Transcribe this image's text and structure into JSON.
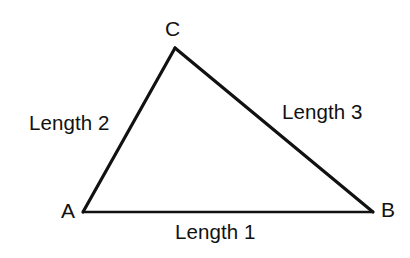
{
  "diagram": {
    "type": "triangle-geometry-diagram",
    "background_color": "#ffffff",
    "stroke_color": "#111111",
    "vertices": [
      {
        "id": "C",
        "label": "C",
        "x": 175,
        "y": 48
      },
      {
        "id": "A",
        "label": "A",
        "x": 83,
        "y": 212
      },
      {
        "id": "B",
        "label": "B",
        "x": 373,
        "y": 212
      }
    ],
    "edges": [
      {
        "id": "AB",
        "label": "Length 1",
        "from": "A",
        "to": "B",
        "stroke_width": 2.4
      },
      {
        "id": "AC",
        "label": "Length 2",
        "from": "A",
        "to": "C",
        "stroke_width": 3.2
      },
      {
        "id": "CB",
        "label": "Length 3",
        "from": "C",
        "to": "B",
        "stroke_width": 3.2
      }
    ],
    "vertex_labels": {
      "c": "C",
      "a": "A",
      "b": "B"
    },
    "edge_labels": {
      "length_1": "Length 1",
      "length_2": "Length 2",
      "length_3": "Length 3"
    }
  }
}
